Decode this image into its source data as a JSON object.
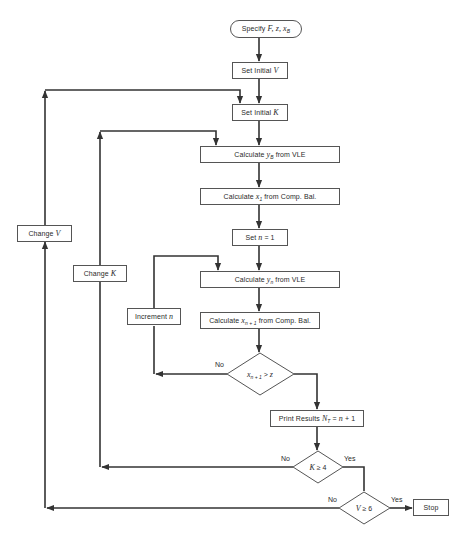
{
  "diagram": {
    "type": "flowchart",
    "nodes": [
      {
        "id": "start",
        "shape": "terminator",
        "prefix": "Specify ",
        "vars": "F, z, x",
        "sub": "B"
      },
      {
        "id": "set_v",
        "shape": "process",
        "prefix": "Set Initial ",
        "var": "V"
      },
      {
        "id": "set_k",
        "shape": "process",
        "prefix": "Set Initial ",
        "var": "K"
      },
      {
        "id": "calc_yb",
        "shape": "process",
        "prefix": "Calculate ",
        "var": "y",
        "sub": "B",
        "suffix": " from VLE"
      },
      {
        "id": "calc_x1",
        "shape": "process",
        "prefix": "Calculate ",
        "var": "x",
        "sub": "1",
        "suffix": " from Comp. Bal."
      },
      {
        "id": "set_n",
        "shape": "process",
        "prefix": "Set ",
        "var": "n",
        "suffix": " = 1"
      },
      {
        "id": "calc_yn",
        "shape": "process",
        "prefix": "Calculate ",
        "var": "y",
        "sub": "n",
        "suffix": " from VLE"
      },
      {
        "id": "calc_xn1",
        "shape": "process",
        "prefix": "Calculate ",
        "var": "x",
        "sub": "n + 1",
        "suffix": " from Comp. Bal."
      },
      {
        "id": "dec_x",
        "shape": "decision",
        "var": "x",
        "sub": "n + 1",
        "op": " > ",
        "rhs": "z"
      },
      {
        "id": "print",
        "shape": "process",
        "prefix": "Print Results ",
        "var": "N",
        "sub": "T",
        "suffix": " = ",
        "var2": "n",
        "suffix2": " + 1"
      },
      {
        "id": "dec_k",
        "shape": "decision",
        "var": "K",
        "op": " ≥ ",
        "rhs": "4"
      },
      {
        "id": "dec_v",
        "shape": "decision",
        "var": "V",
        "op": " ≥ ",
        "rhs": "6"
      },
      {
        "id": "stop",
        "shape": "terminator_box",
        "label": "Stop"
      },
      {
        "id": "inc_n",
        "shape": "process",
        "prefix": "Increment ",
        "var": "n"
      },
      {
        "id": "chg_k",
        "shape": "process",
        "prefix": "Change ",
        "var": "K"
      },
      {
        "id": "chg_v",
        "shape": "process",
        "prefix": "Change ",
        "var": "V"
      }
    ],
    "edge_labels": {
      "dec_x_no": "No",
      "dec_k_no": "No",
      "dec_k_yes": "Yes",
      "dec_v_no": "No",
      "dec_v_yes": "Yes"
    },
    "edges": [
      {
        "from": "start",
        "to": "set_v"
      },
      {
        "from": "set_v",
        "to": "set_k"
      },
      {
        "from": "set_k",
        "to": "calc_yb"
      },
      {
        "from": "calc_yb",
        "to": "calc_x1"
      },
      {
        "from": "calc_x1",
        "to": "set_n"
      },
      {
        "from": "set_n",
        "to": "calc_yn"
      },
      {
        "from": "calc_yn",
        "to": "calc_xn1"
      },
      {
        "from": "calc_xn1",
        "to": "dec_x"
      },
      {
        "from": "dec_x",
        "to": "inc_n",
        "label": "No"
      },
      {
        "from": "inc_n",
        "to": "calc_yn"
      },
      {
        "from": "dec_x",
        "to": "print",
        "label": "Yes (implicit)"
      },
      {
        "from": "print",
        "to": "dec_k"
      },
      {
        "from": "dec_k",
        "to": "chg_k",
        "label": "No"
      },
      {
        "from": "chg_k",
        "to": "calc_yb"
      },
      {
        "from": "dec_k",
        "to": "dec_v",
        "label": "Yes"
      },
      {
        "from": "dec_v",
        "to": "chg_v",
        "label": "No"
      },
      {
        "from": "chg_v",
        "to": "set_k"
      },
      {
        "from": "dec_v",
        "to": "stop",
        "label": "Yes"
      }
    ],
    "colors": {
      "line": "#333333",
      "box_border": "#555555",
      "background": "#ffffff"
    }
  }
}
